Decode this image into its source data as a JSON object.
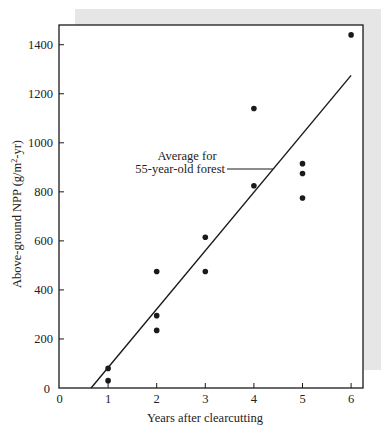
{
  "chart_data": {
    "type": "scatter",
    "title": "",
    "xlabel": "Years after clearcutting",
    "ylabel": "Above-ground NPP (g/m2-yr)",
    "ylabel_parts": {
      "pre": "Above-ground NPP (g/m",
      "sup": "2",
      "post": "-yr)"
    },
    "xlim": [
      0,
      6.25
    ],
    "ylim": [
      0,
      1470
    ],
    "x_ticks": [
      0,
      1,
      2,
      3,
      4,
      5,
      6
    ],
    "y_ticks": [
      0,
      200,
      400,
      600,
      800,
      1000,
      1200,
      1400
    ],
    "grid": false,
    "legend": null,
    "series": [
      {
        "name": "Observed NPP",
        "type": "scatter",
        "points": [
          {
            "x": 1,
            "y": 80
          },
          {
            "x": 1,
            "y": 30
          },
          {
            "x": 2,
            "y": 475
          },
          {
            "x": 2,
            "y": 295
          },
          {
            "x": 2,
            "y": 235
          },
          {
            "x": 3,
            "y": 615
          },
          {
            "x": 3,
            "y": 475
          },
          {
            "x": 4,
            "y": 1140
          },
          {
            "x": 4,
            "y": 825
          },
          {
            "x": 5,
            "y": 915
          },
          {
            "x": 5,
            "y": 875
          },
          {
            "x": 5,
            "y": 775
          },
          {
            "x": 6,
            "y": 1440
          }
        ]
      },
      {
        "name": "Regression line",
        "type": "line",
        "points": [
          {
            "x": 0.65,
            "y": 0
          },
          {
            "x": 6,
            "y": 1275
          }
        ]
      }
    ],
    "annotations": [
      {
        "text_lines": [
          "Average for",
          "55-year-old forest"
        ],
        "points_to": {
          "x": 4.35,
          "y": 890
        }
      }
    ]
  },
  "colors": {
    "ink": "#1a1a1a",
    "shadow": "#e6e6e6",
    "background": "#ffffff"
  }
}
